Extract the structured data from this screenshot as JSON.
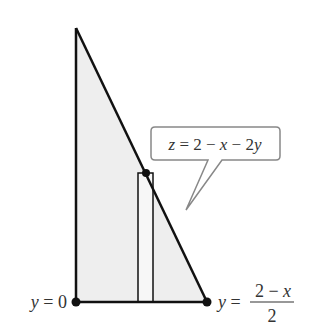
{
  "diagram": {
    "type": "triangular region with vertical strip",
    "colors": {
      "region_fill": "#eeeeee",
      "stroke": "#111111",
      "callout_border": "#888888",
      "text": "#333333"
    },
    "callout": {
      "label": "z = 2 − x − 2y",
      "parts": {
        "z": "z",
        "eq": " = 2 − ",
        "x": "x",
        "minus": " − 2",
        "y": "y"
      }
    },
    "lower_label": {
      "var": "y",
      "eq": " = 0"
    },
    "upper_label": {
      "var": "y",
      "eq": " = ",
      "numerator": "2 − x",
      "num_parts": {
        "two": "2 − ",
        "x": "x"
      },
      "denominator": "2"
    }
  }
}
